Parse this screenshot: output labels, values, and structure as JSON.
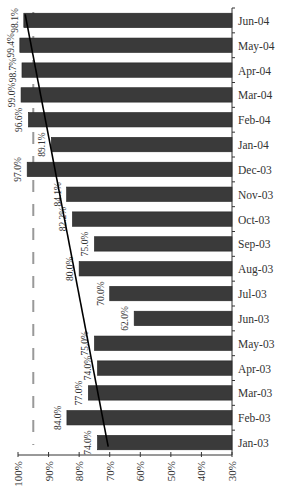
{
  "chart_data": {
    "type": "bar",
    "orientation": "horizontal-reversed",
    "title": "",
    "xlabel": "",
    "ylabel": "",
    "categories": [
      "Jun-04",
      "May-04",
      "Apr-04",
      "Mar-04",
      "Feb-04",
      "Jan-04",
      "Dec-03",
      "Nov-03",
      "Oct-03",
      "Sep-03",
      "Aug-03",
      "Jul-03",
      "Jun-03",
      "May-03",
      "Apr-03",
      "Mar-03",
      "Feb-03",
      "Jan-03"
    ],
    "values": [
      98.1,
      99.4,
      98.7,
      99.0,
      96.6,
      89.1,
      97.0,
      84.1,
      82.2,
      75.0,
      80.0,
      70.0,
      62.0,
      75.0,
      74.0,
      77.0,
      84.0,
      74.0
    ],
    "value_labels": [
      "98.1%",
      "99.4%",
      "98.7%",
      "99.0%",
      "96.6%",
      "89.1%",
      "97.0%",
      "84.1%",
      "82.2%",
      "75.0%",
      "80.0%",
      "70.0%",
      "62.0%",
      "75.0%",
      "74.0%",
      "77.0%",
      "84.0%",
      "74.0%"
    ],
    "value_axis": {
      "range": [
        100,
        30
      ],
      "ticks": [
        "100%",
        "90%",
        "80%",
        "70%",
        "60%",
        "50%",
        "40%",
        "30%"
      ]
    },
    "target_line": {
      "value": 95,
      "style": "dashed",
      "color": "#999999"
    },
    "trend_line": {
      "from": {
        "category": "Jan-03",
        "value": 70.5
      },
      "to": {
        "category": "Jun-04",
        "value": 97.0
      },
      "color": "#000000"
    },
    "bar_color": "#3a3a3a",
    "grid": false,
    "legend": null
  }
}
